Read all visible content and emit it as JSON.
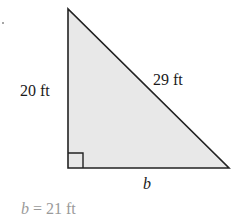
{
  "diagram": {
    "type": "right-triangle",
    "colors": {
      "fill": "#e8e8e8",
      "stroke": "#222222",
      "label": "#1a1a1a",
      "answer": "#9a9a9a"
    },
    "vertices": {
      "top": [
        68,
        9
      ],
      "right_angle": [
        68,
        168
      ],
      "right": [
        229,
        168
      ]
    },
    "labels": {
      "height": "20 ft",
      "hypotenuse": "29 ft",
      "base": "b"
    },
    "answer": {
      "variable": "b",
      "equals": " = ",
      "value": "21 ft"
    }
  }
}
